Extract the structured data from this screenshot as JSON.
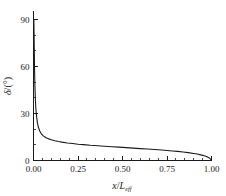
{
  "chart_data": {
    "type": "line",
    "title": "",
    "subtitle": "",
    "xlabel": "x/L",
    "xlabel_italic_var": "x",
    "xlabel_denominator": "L",
    "xlabel_subscript": "eff",
    "ylabel": "δ/(°)",
    "ylabel_symbol": "δ",
    "ylabel_unit": "(°)",
    "xlim": [
      0.0,
      1.0
    ],
    "ylim": [
      0,
      95
    ],
    "xticks": [
      0.0,
      0.25,
      0.5,
      0.75,
      1.0
    ],
    "xtick_labels": [
      "0.00",
      "0.25",
      "0.50",
      "0.75",
      "1.00"
    ],
    "yticks": [
      0,
      30,
      60,
      90
    ],
    "ytick_labels": [
      "0",
      "30",
      "60",
      "90"
    ],
    "x_minor_interval": 0.05,
    "y_minor_interval": 10,
    "grid": false,
    "legend": null,
    "legend_position": "none",
    "spines": [
      "left",
      "bottom"
    ],
    "tick_direction": "in",
    "line_color": "#1a1a1a",
    "background_color": "#ffffff",
    "series": [
      {
        "name": "deflection angle",
        "x": [
          0.0,
          0.002,
          0.004,
          0.006,
          0.008,
          0.01,
          0.013,
          0.017,
          0.022,
          0.028,
          0.035,
          0.043,
          0.052,
          0.062,
          0.073,
          0.085,
          0.1,
          0.12,
          0.14,
          0.16,
          0.19,
          0.22,
          0.25,
          0.28,
          0.32,
          0.36,
          0.4,
          0.44,
          0.48,
          0.52,
          0.56,
          0.6,
          0.64,
          0.68,
          0.72,
          0.75,
          0.78,
          0.81,
          0.84,
          0.87,
          0.9,
          0.92,
          0.94,
          0.96,
          0.975,
          0.985,
          0.992,
          0.997,
          1.0
        ],
        "y": [
          90.0,
          90.0,
          74.0,
          58.0,
          47.5,
          40.5,
          33.5,
          28.2,
          24.0,
          21.0,
          18.8,
          17.2,
          16.0,
          15.1,
          14.4,
          13.8,
          13.2,
          12.6,
          12.1,
          11.7,
          11.2,
          10.8,
          10.4,
          10.1,
          9.7,
          9.4,
          9.1,
          8.8,
          8.5,
          8.2,
          7.9,
          7.6,
          7.3,
          7.0,
          6.7,
          6.4,
          6.1,
          5.8,
          5.4,
          5.0,
          4.5,
          4.1,
          3.6,
          3.0,
          2.4,
          1.8,
          1.2,
          0.6,
          0.2
        ]
      }
    ]
  },
  "axes": {
    "y_axis_name": "delta-axis",
    "x_axis_name": "x-over-L-axis"
  }
}
